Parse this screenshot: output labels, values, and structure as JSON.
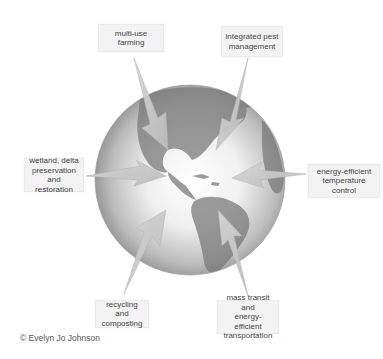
{
  "diagram": {
    "center": "Earth globe (Western Hemisphere, grayscale)",
    "labels": [
      {
        "id": "multi-use-farming",
        "text": "multi-use farming"
      },
      {
        "id": "integrated-pest-management",
        "text": "integrated pest\nmanagement"
      },
      {
        "id": "wetland-delta",
        "text": "wetland, delta\npreservation\nand restoration"
      },
      {
        "id": "energy-efficient-temperature",
        "text": "energy-efficient\ntemperature\ncontrol"
      },
      {
        "id": "recycling-composting",
        "text": "recycling and\ncomposting"
      },
      {
        "id": "mass-transit",
        "text": "mass transit and\nenergy-efficient\ntransportation"
      }
    ],
    "credit": "© Evelyn Jo Johnson"
  },
  "colors": {
    "label_bg": "#f3f3f3",
    "arrow_fill": "#c9c9c9",
    "text": "#444444"
  }
}
